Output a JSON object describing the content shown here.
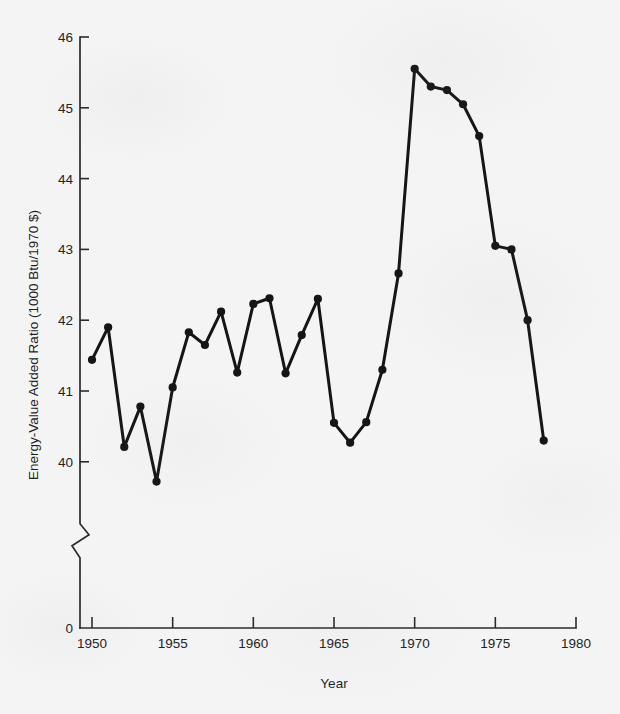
{
  "chart_data": {
    "type": "line",
    "title": "",
    "xlabel": "Year",
    "ylabel": "Energy-Value Added Ratio (1000 Btu/1970 $)",
    "xlim": [
      1950,
      1980
    ],
    "ylim": [
      39.6,
      46
    ],
    "y_axis_break": true,
    "y_axis_zero_label": "0",
    "grid": false,
    "legend": false,
    "xticks": [
      1950,
      1955,
      1960,
      1965,
      1970,
      1975,
      1980
    ],
    "xtick_labels": [
      "1950",
      "1955",
      "1960",
      "1965",
      "1970",
      "1975",
      "1980"
    ],
    "yticks": [
      40,
      41,
      42,
      43,
      44,
      45,
      46
    ],
    "ytick_labels": [
      "40",
      "41",
      "42",
      "43",
      "44",
      "45",
      "46"
    ],
    "marker": "filled-circle",
    "line_color": "#151515",
    "x": [
      1950,
      1951,
      1952,
      1953,
      1954,
      1955,
      1956,
      1957,
      1958,
      1959,
      1960,
      1961,
      1962,
      1963,
      1964,
      1965,
      1966,
      1967,
      1968,
      1969,
      1970,
      1971,
      1972,
      1973,
      1974,
      1975,
      1976,
      1977,
      1978
    ],
    "values": [
      41.44,
      41.9,
      40.21,
      40.78,
      39.72,
      41.05,
      41.83,
      41.65,
      42.12,
      41.26,
      42.23,
      42.31,
      41.25,
      41.79,
      42.3,
      40.55,
      40.27,
      40.56,
      41.3,
      42.66,
      45.55,
      45.3,
      45.25,
      45.05,
      44.6,
      43.05,
      43.0,
      42.0,
      40.3
    ],
    "series": [
      {
        "name": "Energy-Value Added Ratio",
        "values": [
          41.44,
          41.9,
          40.21,
          40.78,
          39.72,
          41.05,
          41.83,
          41.65,
          42.12,
          41.26,
          42.23,
          42.31,
          41.25,
          41.79,
          42.3,
          40.55,
          40.27,
          40.56,
          41.3,
          42.66,
          45.55,
          45.3,
          45.25,
          45.05,
          44.6,
          43.05,
          43.0,
          42.0,
          40.3
        ]
      }
    ]
  }
}
